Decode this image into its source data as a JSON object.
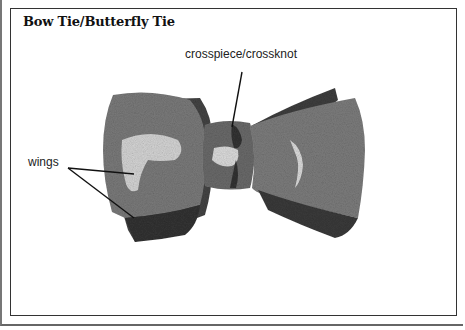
{
  "title": "Bow Tie/Butterfly Tie",
  "labels": {
    "crosspiece": "crosspiece/crossknot",
    "wings": "wings"
  },
  "colors": {
    "frame": "#333333",
    "tie_dark": "#3a3a3a",
    "tie_mid": "#6e6e6e",
    "tie_light": "#9a9a9a",
    "highlight": "#e6e6e6"
  }
}
